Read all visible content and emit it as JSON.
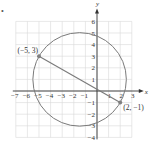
{
  "bullet": "•",
  "chart_data": {
    "type": "scatter",
    "title": "",
    "xlabel": "x",
    "ylabel": "y",
    "xlim": [
      -7,
      3
    ],
    "ylim": [
      -4,
      6
    ],
    "grid": true,
    "x_ticks": [
      -7,
      -6,
      -5,
      -4,
      -3,
      -2,
      -1,
      1,
      2,
      3
    ],
    "y_ticks": [
      -4,
      -3,
      -2,
      -1,
      1,
      2,
      3,
      4,
      5,
      6
    ],
    "x_tick_labels": [
      "−7",
      "−6",
      "−5",
      "−4",
      "−3",
      "−2",
      "−1",
      "1",
      "2",
      "3"
    ],
    "y_tick_labels": [
      "−4",
      "−3",
      "−2",
      "−1",
      "1",
      "2",
      "3",
      "4",
      "5",
      "6"
    ],
    "points": [
      {
        "x": -5,
        "y": 3,
        "label": "(−5, 3)"
      },
      {
        "x": 2,
        "y": -1,
        "label": "(2, −1)"
      }
    ],
    "segment": {
      "from": [
        -5,
        3
      ],
      "to": [
        2,
        -1
      ]
    },
    "circle": {
      "center": [
        -1.5,
        1
      ],
      "radius": 4.03
    },
    "colors": {
      "grid": "#d9d9d9",
      "axis": "#333333",
      "curve": "#7a7a7a",
      "point": "#808080"
    }
  }
}
